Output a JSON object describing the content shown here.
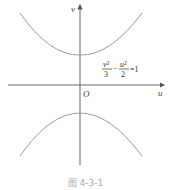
{
  "figure": {
    "caption": "图 4-3-1",
    "axes": {
      "x_label": "u",
      "y_label": "v",
      "origin_label": "O"
    },
    "equation": {
      "term1_num": "v²",
      "term1_den": "3",
      "minus": "−",
      "term2_num": "u²",
      "term2_den": "2",
      "rhs": "=1"
    },
    "curve_type": "hyperbola",
    "colors": {
      "axis": "#555555",
      "curve": "#9a9a9a",
      "caption": "#aaaaaa"
    }
  }
}
